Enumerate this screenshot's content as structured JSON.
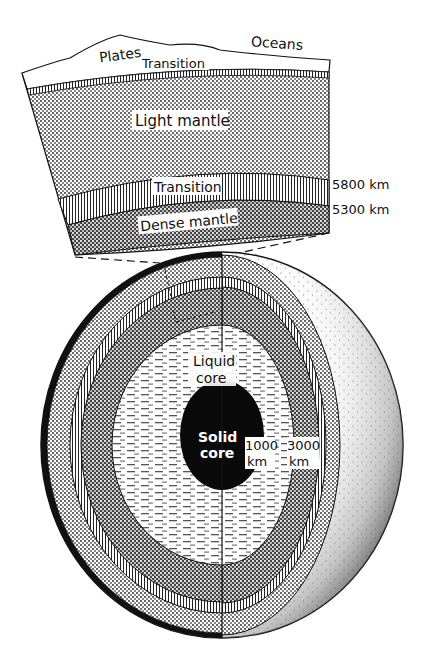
{
  "diagram": {
    "wedge_labels": {
      "plates": "Plates",
      "oceans": "Oceans",
      "transition_top": "Transition",
      "light_mantle": "Light mantle",
      "transition_mid": "Transition",
      "dense_mantle": "Dense mantle"
    },
    "depth_markers": {
      "upper": "5800 km",
      "lower": "5300 km"
    },
    "sphere_labels": {
      "liquid_core_line1": "Liquid",
      "liquid_core_line2": "core",
      "solid_core_line1": "Solid",
      "solid_core_line2": "core",
      "radius_inner_value": "1000",
      "radius_inner_unit": "km",
      "radius_outer_value": "3000",
      "radius_outer_unit": "km"
    },
    "layers": [
      {
        "name": "Plates / crust",
        "pattern": "blank"
      },
      {
        "name": "Transition",
        "pattern": "fine vertical hatch"
      },
      {
        "name": "Light mantle",
        "pattern": "light dots"
      },
      {
        "name": "Transition",
        "pattern": "vertical stripes"
      },
      {
        "name": "Dense mantle",
        "pattern": "dark checker"
      },
      {
        "name": "Liquid core",
        "pattern": "horizontal dashes"
      },
      {
        "name": "Solid core",
        "pattern": "solid black"
      }
    ],
    "colors": {
      "ink": "#111111",
      "paper": "#ffffff"
    }
  }
}
